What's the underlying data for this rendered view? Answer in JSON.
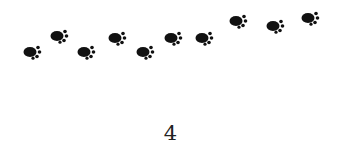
{
  "illustration": {
    "description": "trail of paw prints",
    "paw_count": 11,
    "paw_color": "#111111",
    "icon": "paw-print-icon"
  },
  "count_label": "4"
}
